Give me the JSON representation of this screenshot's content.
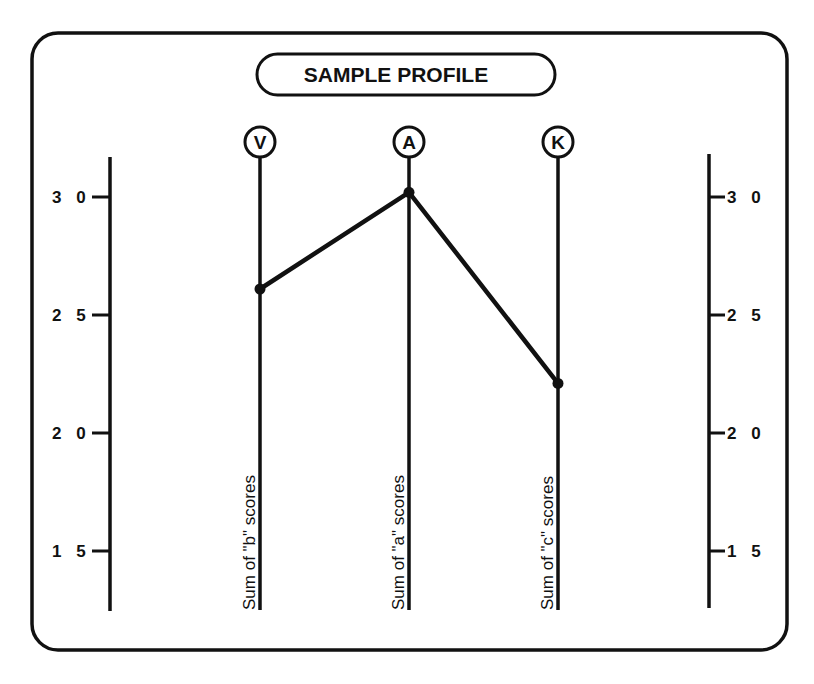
{
  "chart_data": {
    "type": "line",
    "title": "SAMPLE PROFILE",
    "categories": [
      "V",
      "A",
      "K"
    ],
    "category_captions": [
      "Sum of \"b\" scores",
      "Sum of \"a\" scores",
      "Sum of \"c\" scores"
    ],
    "series": [
      {
        "name": "Sample profile",
        "values": [
          26.1,
          30.2,
          22.1
        ]
      }
    ],
    "yticks": [
      30,
      25,
      20,
      15
    ],
    "ytick_labels_left": [
      "3 0",
      "2 5",
      "2 0",
      "1 5"
    ],
    "ytick_labels_right": [
      "3 0",
      "2 5",
      "2 0",
      "1 5"
    ],
    "ylim": [
      13,
      31.7
    ],
    "xlabel": "",
    "ylabel": "",
    "grid": false,
    "legend": null,
    "colors": {
      "ink": "#111111",
      "background": "#ffffff"
    }
  }
}
